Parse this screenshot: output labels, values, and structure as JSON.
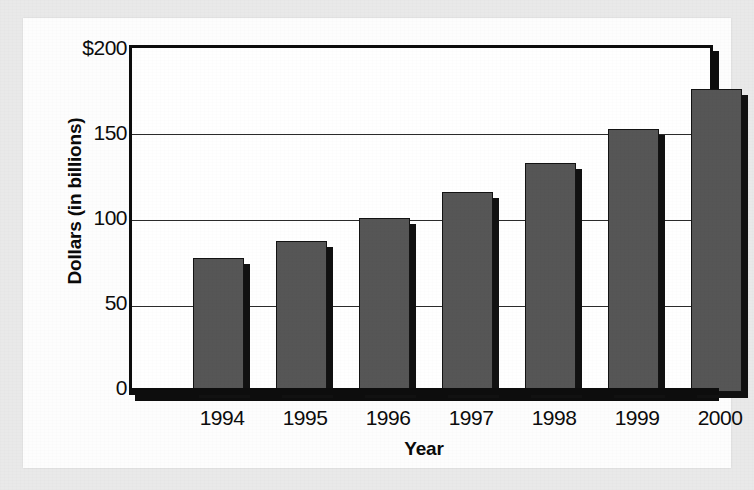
{
  "chart_data": {
    "type": "bar",
    "title": "",
    "subtitle": "",
    "xlabel": "Year",
    "ylabel": "Dollars (in billions)",
    "categories": [
      "1994",
      "1995",
      "1996",
      "1997",
      "1998",
      "1999",
      "2000"
    ],
    "values": [
      78,
      88,
      101,
      116,
      133,
      153,
      176
    ],
    "series": [
      {
        "name": "Dollars (in billions)",
        "values": [
          78,
          88,
          101,
          116,
          133,
          153,
          176
        ]
      }
    ],
    "ylim": [
      0,
      200
    ],
    "ytick_values": [
      0,
      50,
      100,
      150,
      200
    ],
    "ytick_labels": [
      "0",
      "50",
      "100",
      "150",
      "$200"
    ],
    "xtick_labels": [
      "1994",
      "1995",
      "1996",
      "1997",
      "1998",
      "1999",
      "2000"
    ],
    "grid": true,
    "grid_axis": "y",
    "legend": false,
    "legend_position": "none",
    "bar_color": "#565656",
    "bar_edge_color": "#131313",
    "bar_shadow_color": "#111111",
    "axis_color": "#0d0d0d",
    "plot_background": "#ffffff",
    "page_background": "#fdfdfd",
    "surround_background": "#e9e9e9"
  }
}
